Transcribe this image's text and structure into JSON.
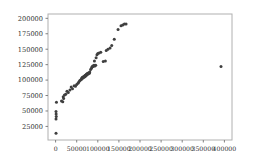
{
  "chart_data": {
    "type": "scatter",
    "title": "",
    "xlabel": "",
    "ylabel": "",
    "xlim": [
      -18000,
      418000
    ],
    "ylim": [
      3000,
      207000
    ],
    "grid": false,
    "legend": null,
    "marker": {
      "color": "#3f3f3f",
      "size": 3.0,
      "shape": "circle"
    },
    "xticks": [
      0,
      50000,
      100000,
      150000,
      200000,
      250000,
      300000,
      350000,
      400000
    ],
    "xtick_labels": [
      "0",
      "50000",
      "100000",
      "150000",
      "200000",
      "250000",
      "300000",
      "350000",
      "400000"
    ],
    "yticks": [
      25000,
      50000,
      75000,
      100000,
      125000,
      150000,
      175000,
      200000
    ],
    "ytick_labels": [
      "25000",
      "50000",
      "75000",
      "100000",
      "125000",
      "150000",
      "175000",
      "200000"
    ],
    "points": [
      [
        1000,
        14000
      ],
      [
        1000,
        37000
      ],
      [
        1500,
        41000
      ],
      [
        1200,
        45000
      ],
      [
        1000,
        49000
      ],
      [
        2000,
        64000
      ],
      [
        14000,
        66000
      ],
      [
        17000,
        65000
      ],
      [
        18000,
        73000
      ],
      [
        19000,
        70000
      ],
      [
        21000,
        76000
      ],
      [
        24000,
        77000
      ],
      [
        27000,
        82000
      ],
      [
        30000,
        80000
      ],
      [
        34000,
        84000
      ],
      [
        37000,
        89000
      ],
      [
        40000,
        86000
      ],
      [
        44000,
        91000
      ],
      [
        47000,
        90000
      ],
      [
        50000,
        93000
      ],
      [
        53000,
        95000
      ],
      [
        55000,
        97000
      ],
      [
        57000,
        99000
      ],
      [
        59000,
        100000
      ],
      [
        61000,
        101000
      ],
      [
        62000,
        103000
      ],
      [
        63000,
        104000
      ],
      [
        64000,
        103000
      ],
      [
        65000,
        105000
      ],
      [
        66000,
        104000
      ],
      [
        67000,
        106000
      ],
      [
        68000,
        105000
      ],
      [
        69000,
        107000
      ],
      [
        70000,
        106000
      ],
      [
        70500,
        108000
      ],
      [
        71000,
        107000
      ],
      [
        72000,
        108000
      ],
      [
        72500,
        109000
      ],
      [
        73000,
        108000
      ],
      [
        74000,
        110000
      ],
      [
        74500,
        109000
      ],
      [
        75000,
        110000
      ],
      [
        76000,
        111000
      ],
      [
        77000,
        110000
      ],
      [
        78000,
        111000
      ],
      [
        79000,
        112000
      ],
      [
        80000,
        111000
      ],
      [
        81000,
        113000
      ],
      [
        83000,
        117000
      ],
      [
        85000,
        119000
      ],
      [
        86000,
        121000
      ],
      [
        88000,
        123000
      ],
      [
        89000,
        122000
      ],
      [
        91000,
        124000
      ],
      [
        93000,
        123000
      ],
      [
        95000,
        124000
      ],
      [
        92000,
        131000
      ],
      [
        96000,
        136000
      ],
      [
        98000,
        141000
      ],
      [
        100000,
        143000
      ],
      [
        103000,
        144000
      ],
      [
        107000,
        145000
      ],
      [
        113000,
        130000
      ],
      [
        118000,
        131000
      ],
      [
        120000,
        148000
      ],
      [
        124000,
        150000
      ],
      [
        129000,
        152000
      ],
      [
        133000,
        156000
      ],
      [
        139000,
        166000
      ],
      [
        148000,
        182000
      ],
      [
        155000,
        188000
      ],
      [
        159000,
        189000
      ],
      [
        163000,
        191000
      ],
      [
        167000,
        191000
      ],
      [
        392000,
        122000
      ]
    ]
  },
  "figure": {
    "background_color": "#ffffff",
    "axes_background_color": "#ffffff",
    "spine_color": "#b0b0b0",
    "tick_color": "#808080",
    "tick_label_color": "#303030"
  }
}
